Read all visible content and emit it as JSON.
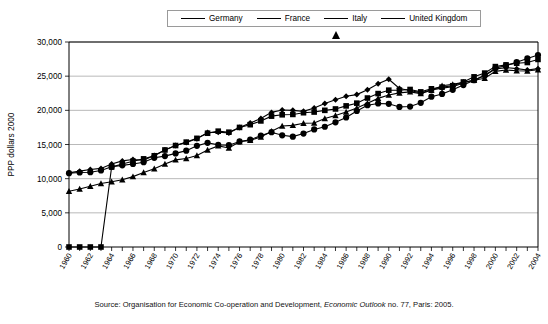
{
  "legend": {
    "position": "top-center",
    "entries": [
      {
        "label": "Germany",
        "marker": "diamond-icon"
      },
      {
        "label": "France",
        "marker": "square-icon"
      },
      {
        "label": "Italy",
        "marker": "triangle-icon"
      },
      {
        "label": "United Kingdom",
        "marker": "circle-icon"
      }
    ]
  },
  "source": {
    "prefix": "Source: Organisation for Economic Co-operation and Development, ",
    "italic": "Economic Outlook",
    "suffix": " no. 77, Paris: 2005."
  },
  "chart_data": {
    "type": "line",
    "title": "",
    "xlabel": "",
    "ylabel": "PPP dollars 2000",
    "ylim": [
      0,
      30000
    ],
    "yticks": [
      0,
      5000,
      10000,
      15000,
      20000,
      25000,
      30000
    ],
    "ytick_labels": [
      "0",
      "5,000",
      "10,000",
      "15,000",
      "20,000",
      "25,000",
      "30,000"
    ],
    "grid": true,
    "legend_position": "top-center",
    "x": [
      1960,
      1961,
      1962,
      1963,
      1964,
      1965,
      1966,
      1967,
      1968,
      1969,
      1970,
      1971,
      1972,
      1973,
      1974,
      1975,
      1976,
      1977,
      1978,
      1979,
      1980,
      1981,
      1982,
      1983,
      1984,
      1985,
      1986,
      1987,
      1988,
      1989,
      1990,
      1991,
      1992,
      1993,
      1994,
      1995,
      1996,
      1997,
      1998,
      1999,
      2000,
      2001,
      2002,
      2003,
      2004
    ],
    "xtick_labels": [
      "1960",
      "1962",
      "1964",
      "1966",
      "1968",
      "1970",
      "1972",
      "1974",
      "1976",
      "1978",
      "1980",
      "1982",
      "1984",
      "1986",
      "1988",
      "1990",
      "1992",
      "1994",
      "1996",
      "1998",
      "2000",
      "2002",
      "2004"
    ],
    "xlim": [
      1960,
      2004
    ],
    "series": [
      {
        "name": "Germany",
        "marker": "diamond",
        "values": [
          10850,
          11100,
          11350,
          11500,
          12150,
          12600,
          12800,
          12700,
          13400,
          14200,
          14850,
          15300,
          15850,
          16750,
          16800,
          16700,
          17500,
          18150,
          18800,
          19700,
          20050,
          20000,
          19850,
          20350,
          21000,
          21550,
          22050,
          22300,
          23000,
          23900,
          24550,
          23200,
          22900,
          22550,
          23000,
          23250,
          23450,
          24000,
          24450,
          25100,
          26050,
          26250,
          26100,
          25900,
          26100
        ]
      },
      {
        "name": "France",
        "marker": "square",
        "values": [
          0,
          0,
          0,
          0,
          11700,
          12150,
          12550,
          12900,
          13350,
          14200,
          14850,
          15350,
          15900,
          16650,
          16950,
          16800,
          17500,
          17900,
          18450,
          19150,
          19350,
          19400,
          19650,
          19750,
          20000,
          20200,
          20650,
          21050,
          21800,
          22450,
          22950,
          22950,
          23050,
          22700,
          23150,
          23400,
          23600,
          24150,
          24900,
          25450,
          26400,
          26650,
          26900,
          27000,
          27450
        ]
      },
      {
        "name": "Italy",
        "marker": "triangle",
        "values": [
          8150,
          8500,
          8900,
          9300,
          9550,
          9850,
          10300,
          10900,
          11450,
          12150,
          12750,
          12950,
          13400,
          14200,
          14800,
          14500,
          15400,
          15600,
          16100,
          16950,
          17700,
          17800,
          18100,
          18150,
          18800,
          19250,
          19750,
          20350,
          21050,
          21750,
          22250,
          22550,
          22700,
          22450,
          22950,
          23600,
          23800,
          24100,
          24400,
          24700,
          25700,
          25900,
          25800,
          25750,
          25950
        ]
      },
      {
        "name": "United Kingdom",
        "marker": "circle",
        "values": [
          10800,
          10900,
          10950,
          11200,
          11750,
          11950,
          12150,
          12400,
          13050,
          13300,
          13700,
          14100,
          14800,
          15250,
          14950,
          14900,
          15450,
          15700,
          16300,
          16800,
          16350,
          16150,
          16600,
          17200,
          17600,
          18250,
          18950,
          19900,
          20750,
          21000,
          20950,
          20500,
          20550,
          21100,
          22000,
          22400,
          23000,
          23700,
          24400,
          25100,
          26150,
          26550,
          27050,
          27600,
          28100
        ]
      }
    ]
  }
}
